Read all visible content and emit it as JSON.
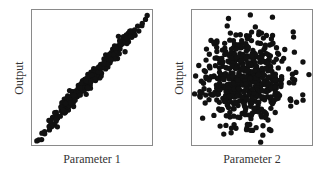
{
  "chart_data": [
    {
      "type": "scatter",
      "title": "",
      "xlabel": "Parameter 1",
      "ylabel": "Output",
      "grid": false,
      "ticks": false,
      "xlim": [
        0,
        1
      ],
      "ylim": [
        0,
        1
      ],
      "description": "Strong positive linear correlation",
      "point_color": "#111111",
      "generator": {
        "seed": 7,
        "n": 320,
        "mode": "correlated",
        "noise": 0.025
      }
    },
    {
      "type": "scatter",
      "title": "",
      "xlabel": "Parameter 2",
      "ylabel": "Output",
      "grid": false,
      "ticks": false,
      "xlim": [
        0,
        1
      ],
      "ylim": [
        0,
        1
      ],
      "description": "No correlation, round gaussian cloud",
      "point_color": "#111111",
      "generator": {
        "seed": 11,
        "n": 600,
        "mode": "uncorrelated",
        "sd": 0.17
      }
    }
  ],
  "labels": {
    "left_x": "Parameter 1",
    "left_y": "Output",
    "right_x": "Parameter 2",
    "right_y": "Output"
  }
}
